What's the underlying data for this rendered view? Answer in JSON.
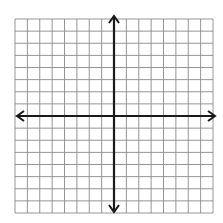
{
  "diagram": {
    "type": "coordinate-plane",
    "grid": {
      "columns": 16,
      "rows": 16,
      "line_color": "#8a8a8a"
    },
    "axes": {
      "color": "#1a1a1a",
      "x_axis_arrows": "both",
      "y_axis_arrows": "both"
    },
    "labels": []
  }
}
